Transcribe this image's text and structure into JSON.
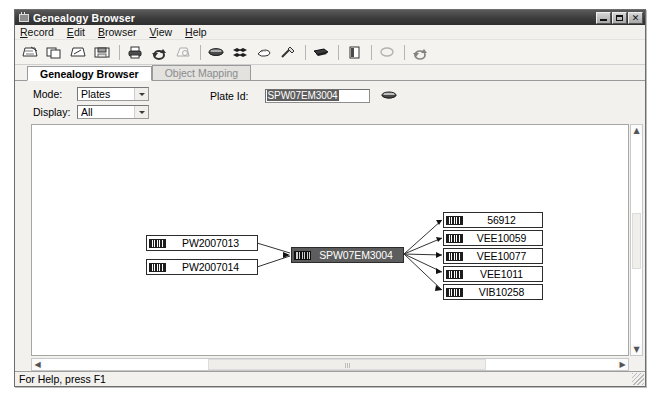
{
  "window": {
    "title": "Genealogy Browser",
    "icon": "plate-window-icon",
    "controls": {
      "minimize": "minimize-button",
      "maximize": "maximize-button",
      "close": "✕"
    }
  },
  "menu": {
    "items": [
      {
        "label": "Record",
        "accel": "R"
      },
      {
        "label": "Edit",
        "accel": "E"
      },
      {
        "label": "Browser",
        "accel": "B"
      },
      {
        "label": "View",
        "accel": "V"
      },
      {
        "label": "Help",
        "accel": "H"
      }
    ]
  },
  "toolbar": {
    "buttons": [
      {
        "name": "open-genealogy-icon",
        "enabled": true
      },
      {
        "name": "new-record-icon",
        "enabled": true
      },
      {
        "name": "open-record-icon",
        "enabled": true
      },
      {
        "name": "save-icon",
        "enabled": true
      },
      {
        "name": "print-icon",
        "enabled": true
      },
      {
        "name": "refresh-icon",
        "enabled": true
      },
      {
        "name": "print-preview-icon",
        "enabled": false
      },
      {
        "name": "plate-icon",
        "enabled": true
      },
      {
        "name": "multi-plate-icon",
        "enabled": true
      },
      {
        "name": "glove-icon",
        "enabled": true
      },
      {
        "name": "pipette-icon",
        "enabled": true
      },
      {
        "name": "tray-icon",
        "enabled": true
      },
      {
        "name": "document-icon",
        "enabled": true
      },
      {
        "name": "ellipse-icon",
        "enabled": false
      },
      {
        "name": "recycle-icon",
        "enabled": true
      }
    ]
  },
  "tabs": [
    {
      "label": "Genealogy Browser",
      "active": true,
      "enabled": true
    },
    {
      "label": "Object Mapping",
      "active": false,
      "enabled": false
    }
  ],
  "form": {
    "mode": {
      "label": "Mode:",
      "value": "Plates"
    },
    "display": {
      "label": "Display:",
      "value": "All"
    },
    "plate_id": {
      "label": "Plate Id:",
      "value": "SPW07EM3004",
      "selected": true,
      "browse_icon": "plate-browse-icon"
    }
  },
  "graph": {
    "parents": [
      {
        "label": "PW2007013",
        "icon": "plate-node-icon"
      },
      {
        "label": "PW2007014",
        "icon": "plate-node-icon"
      }
    ],
    "focus": {
      "label": "SPW07EM3004",
      "icon": "plate-node-icon",
      "selected": true
    },
    "children": [
      {
        "label": "56912",
        "icon": "plate-node-icon"
      },
      {
        "label": "VEE10059",
        "icon": "plate-node-icon"
      },
      {
        "label": "VEE10077",
        "icon": "plate-node-icon"
      },
      {
        "label": "VEE1011",
        "icon": "plate-node-icon"
      },
      {
        "label": "VIB10258",
        "icon": "plate-node-icon"
      }
    ]
  },
  "scrollbars": {
    "vertical": {
      "up": "▲",
      "down": "▼"
    },
    "horizontal": {
      "left": "◀",
      "right": "▶"
    }
  },
  "status": {
    "text": "For Help, press F1"
  }
}
